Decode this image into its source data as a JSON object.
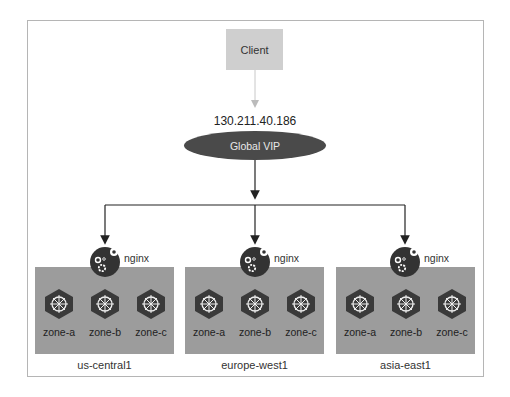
{
  "client": {
    "label": "Client"
  },
  "vip": {
    "ip": "130.211.40.186",
    "label": "Global VIP"
  },
  "load_balancer": {
    "label": "nginx"
  },
  "regions": [
    {
      "name": "us-central1",
      "zones": [
        "zone-a",
        "zone-b",
        "zone-c"
      ]
    },
    {
      "name": "europe-west1",
      "zones": [
        "zone-a",
        "zone-b",
        "zone-c"
      ]
    },
    {
      "name": "asia-east1",
      "zones": [
        "zone-a",
        "zone-b",
        "zone-c"
      ]
    }
  ],
  "colors": {
    "client_box": "#cfcfcf",
    "vip": "#4a4a4a",
    "region_box": "#9c9c9c",
    "node_icon": "#3a3a3a"
  }
}
